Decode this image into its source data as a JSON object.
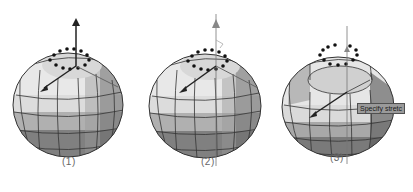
{
  "figure": {
    "panels": [
      {
        "id": "panel-1",
        "caption": "(1)",
        "state": "polygon-selected"
      },
      {
        "id": "panel-2",
        "caption": "(2)",
        "state": "gizmo-active"
      },
      {
        "id": "panel-3",
        "caption": "(3)",
        "state": "extruded",
        "tooltip": "Specify stretc"
      }
    ],
    "colors": {
      "light_face": "#f0f0f0",
      "mid_face": "#c8c8c8",
      "dark_face": "#8a8a8a",
      "darker_face": "#5a5a5a",
      "edge": "#333333",
      "gizmo_dark": "#222222",
      "gizmo_grey": "#888888",
      "selection_dot": "#111111"
    }
  }
}
